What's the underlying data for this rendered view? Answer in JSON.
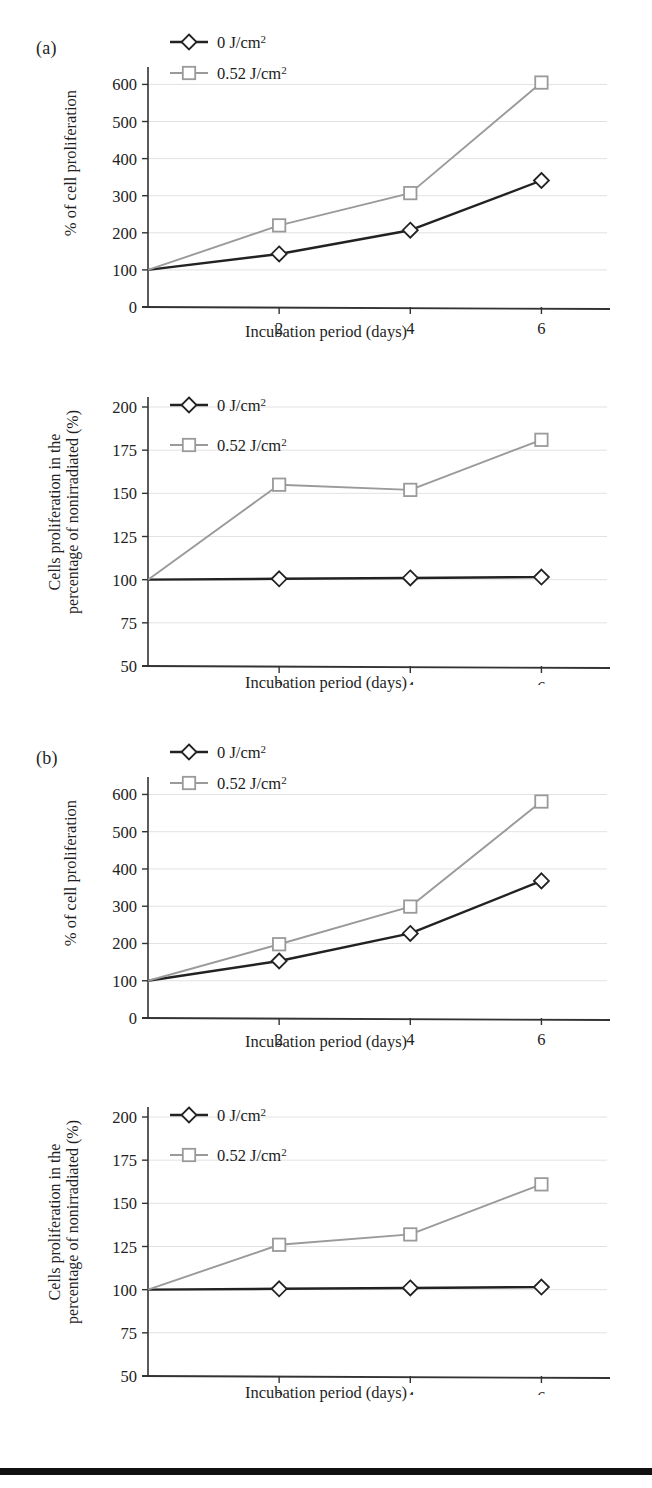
{
  "figure": {
    "panels": [
      {
        "label": "(a)",
        "label_x": 36,
        "label_y": 40
      },
      {
        "label": "(b)",
        "label_x": 36,
        "label_y": 750
      }
    ],
    "bottom_rule": {
      "y": 1468,
      "height": 7,
      "color": "#111111"
    }
  },
  "series_colors": {
    "control": "#222222",
    "irradiated": "#9a9a9a",
    "gridline": "#e2e2e2",
    "axis": "#333333"
  },
  "chart_data": [
    {
      "id": "a-top",
      "type": "line",
      "title": "",
      "panel": "(a)",
      "xlabel": "Incubation period (days)",
      "ylabel": "% of cell proliferation",
      "ylabel_lines": [
        "% of cell proliferation"
      ],
      "x": [
        0,
        2,
        4,
        6
      ],
      "categories": [
        "2",
        "4",
        "6"
      ],
      "xtick_labels": [
        "2",
        "4",
        "6"
      ],
      "ytick_labels": [
        "0",
        "100",
        "200",
        "300",
        "400",
        "500",
        "600"
      ],
      "yticks": [
        0,
        100,
        200,
        300,
        400,
        500,
        600
      ],
      "ylim": [
        0,
        620
      ],
      "xlim": [
        0,
        7
      ],
      "grid": true,
      "legend_position": "top-left",
      "series": [
        {
          "name": "0 J/cm2",
          "legend": "0 J/cm",
          "legend_sup": "2",
          "marker": "diamond",
          "color": "#222222",
          "values": [
            100,
            143,
            207,
            341
          ]
        },
        {
          "name": "0.52 J/cm2",
          "legend": "0.52 J/cm",
          "legend_sup": "2",
          "marker": "square",
          "color": "#9a9a9a",
          "values": [
            100,
            220,
            307,
            605
          ]
        }
      ]
    },
    {
      "id": "a-bottom",
      "type": "line",
      "title": "",
      "panel": "(a)",
      "xlabel": "Incubation period (days)",
      "ylabel": "Cells proliferation in the percentage of nonirradiated (%)",
      "ylabel_lines": [
        "Cells proliferation in the",
        "percentage of nonirradiated (%)"
      ],
      "x": [
        0,
        2,
        4,
        6
      ],
      "categories": [
        "2",
        "4",
        "6"
      ],
      "xtick_labels": [
        "2",
        "4",
        "6"
      ],
      "ytick_labels": [
        "50",
        "75",
        "100",
        "125",
        "150",
        "175",
        "200"
      ],
      "yticks": [
        50,
        75,
        100,
        125,
        150,
        175,
        200
      ],
      "ylim": [
        50,
        200
      ],
      "xlim": [
        0,
        7
      ],
      "grid": true,
      "legend_position": "top-left",
      "series": [
        {
          "name": "0 J/cm2",
          "legend": "0 J/cm",
          "legend_sup": "2",
          "marker": "diamond",
          "color": "#222222",
          "values": [
            100,
            100.5,
            101,
            101.5
          ]
        },
        {
          "name": "0.52 J/cm2",
          "legend": "0.52 J/cm",
          "legend_sup": "2",
          "marker": "square",
          "color": "#9a9a9a",
          "values": [
            100,
            155,
            152,
            181
          ]
        }
      ]
    },
    {
      "id": "b-top",
      "type": "line",
      "title": "",
      "panel": "(b)",
      "xlabel": "Incubation period (days)",
      "ylabel": "% of cell proliferation",
      "ylabel_lines": [
        "% of cell proliferation"
      ],
      "x": [
        0,
        2,
        4,
        6
      ],
      "categories": [
        "2",
        "4",
        "6"
      ],
      "xtick_labels": [
        "2",
        "4",
        "6"
      ],
      "ytick_labels": [
        "0",
        "100",
        "200",
        "300",
        "400",
        "500",
        "600"
      ],
      "yticks": [
        0,
        100,
        200,
        300,
        400,
        500,
        600
      ],
      "ylim": [
        0,
        620
      ],
      "xlim": [
        0,
        7
      ],
      "grid": true,
      "legend_position": "top-left",
      "series": [
        {
          "name": "0 J/cm2",
          "legend": "0 J/cm",
          "legend_sup": "2",
          "marker": "diamond",
          "color": "#222222",
          "values": [
            100,
            153,
            227,
            368
          ]
        },
        {
          "name": "0.52 J/cm2",
          "legend": "0.52 J/cm",
          "legend_sup": "2",
          "marker": "square",
          "color": "#9a9a9a",
          "values": [
            100,
            198,
            299,
            581
          ]
        }
      ]
    },
    {
      "id": "b-bottom",
      "type": "line",
      "title": "",
      "panel": "(b)",
      "xlabel": "Incubation period (days)",
      "ylabel": "Cells proliferation in the percentage of nonirradiated (%)",
      "ylabel_lines": [
        "Cells proliferation in the",
        "percentage of nonirradiated (%)"
      ],
      "x": [
        0,
        2,
        4,
        6
      ],
      "categories": [
        "2",
        "4",
        "6"
      ],
      "xtick_labels": [
        "2",
        "4",
        "6"
      ],
      "ytick_labels": [
        "50",
        "75",
        "100",
        "125",
        "150",
        "175",
        "200"
      ],
      "yticks": [
        50,
        75,
        100,
        125,
        150,
        175,
        200
      ],
      "ylim": [
        50,
        200
      ],
      "xlim": [
        0,
        7
      ],
      "grid": true,
      "legend_position": "top-left",
      "series": [
        {
          "name": "0 J/cm2",
          "legend": "0 J/cm",
          "legend_sup": "2",
          "marker": "diamond",
          "color": "#222222",
          "values": [
            100,
            100.5,
            101,
            101.5
          ]
        },
        {
          "name": "0.52 J/cm2",
          "legend": "0.52 J/cm",
          "legend_sup": "2",
          "marker": "square",
          "color": "#9a9a9a",
          "values": [
            100,
            126,
            132,
            161
          ]
        }
      ]
    }
  ]
}
